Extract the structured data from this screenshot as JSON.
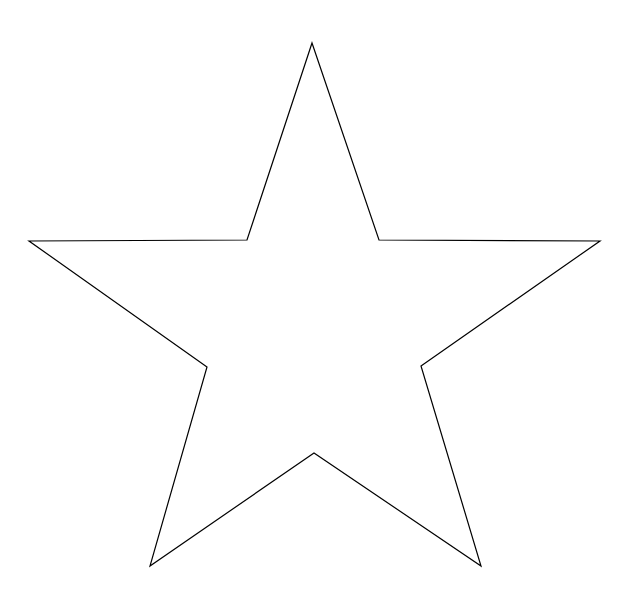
{
  "canvas": {
    "width": 632,
    "height": 602,
    "background": "#ffffff"
  },
  "shape": {
    "type": "five-pointed-star",
    "stroke": "#000000",
    "fill": "none",
    "stroke_width": 1.2,
    "outer_points": [
      [
        312,
        43
      ],
      [
        600,
        241
      ],
      [
        481,
        566
      ],
      [
        150,
        566
      ],
      [
        29,
        241
      ]
    ],
    "inner_points": [
      [
        379,
        240
      ],
      [
        421,
        366
      ],
      [
        314,
        453
      ],
      [
        207,
        367
      ],
      [
        247,
        240
      ]
    ],
    "points": "312,43 379,240 600,241 421,366 481,566 314,453 150,566 207,367 29,241 247,240"
  }
}
